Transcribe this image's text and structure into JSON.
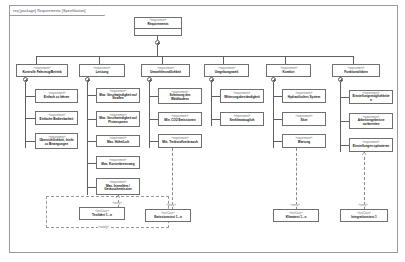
{
  "diagram": {
    "frame_label": "req [package] Requirements [Spezifikation]",
    "stereotype_requirement": "«requirement»",
    "stereotype_testcase": "«testCase»",
    "edge_label_satisfy": "«satisfy»",
    "edge_label_verify": "«verify»"
  },
  "root": {
    "stereotype": "«requirement»",
    "name": "Requirements"
  },
  "columns": [
    {
      "id": "col-1",
      "header": {
        "stereotype": "«requirement»",
        "name": "Kontrolle Fahrzeug/Betrieb"
      },
      "children": [
        {
          "stereotype": "«requirement»",
          "name": "Einfach zu fahren"
        },
        {
          "stereotype": "«requirement»",
          "name": "Einfache Bedienbarkeit"
        },
        {
          "stereotype": "«requirement»",
          "name": "Übersichtlichkeit, leicht zu Bewegungen"
        }
      ]
    },
    {
      "id": "col-2",
      "header": {
        "stereotype": "«requirement»",
        "name": "Leistung"
      },
      "children": [
        {
          "stereotype": "«requirement»",
          "name": "Max. Geschwindigkeit auf Straßen"
        },
        {
          "stereotype": "«requirement»",
          "name": "Max. Geschwindigkeit auf Pistenspuren"
        },
        {
          "stereotype": "«requirement»",
          "name": "Max. Höhe/Luft"
        },
        {
          "stereotype": "«requirement»",
          "name": "Max. Kurvenbremsweg"
        },
        {
          "stereotype": "«requirement»",
          "name": "Max. Innenlärm / Geräuschemission"
        }
      ]
    },
    {
      "id": "col-3",
      "header": {
        "stereotype": "«requirement»",
        "name": "Umweltfreundlichkeit"
      },
      "children": [
        {
          "stereotype": "«requirement»",
          "name": "Schonung des Waldbodens"
        },
        {
          "stereotype": "«requirement»",
          "name": "Min. CO2 Emissionen"
        },
        {
          "stereotype": "«requirement»",
          "name": "Min. Treibstoffverbrauch"
        }
      ]
    },
    {
      "id": "col-4",
      "header": {
        "stereotype": "«requirement»",
        "name": "Umgebungswelt"
      },
      "children": [
        {
          "stereotype": "«requirement»",
          "name": "Witterungsbeständigkeit"
        },
        {
          "stereotype": "«requirement»",
          "name": "Seeklimatauglich"
        }
      ]
    },
    {
      "id": "col-5",
      "header": {
        "stereotype": "«requirement»",
        "name": "Komfort"
      },
      "children": [
        {
          "stereotype": "«requirement»",
          "name": "Hydraulisches System"
        },
        {
          "stereotype": "«requirement»",
          "name": "Sitze"
        },
        {
          "stereotype": "«requirement»",
          "name": "Wartung"
        }
      ]
    },
    {
      "id": "col-6",
      "header": {
        "stereotype": "«requirement»",
        "name": "Funktionalitäten"
      },
      "children": [
        {
          "stereotype": "«requirement»",
          "name": "Einstellungsmöglichkeiten"
        },
        {
          "stereotype": "«requirement»",
          "name": "Arbeitsergebnisse vorbereiten"
        },
        {
          "stereotype": "«requirement»",
          "name": "Einstellungen optimieren"
        }
      ]
    }
  ],
  "testcases": [
    {
      "stereotype": "«testCase»",
      "name": "Testfahrt 1...n"
    },
    {
      "stereotype": "«testCase»",
      "name": "Emissionstest 1...n"
    },
    {
      "stereotype": "«testCase»",
      "name": "Klimatest 1...n"
    },
    {
      "stereotype": "«testCase»",
      "name": "Integrationstest 1"
    }
  ]
}
